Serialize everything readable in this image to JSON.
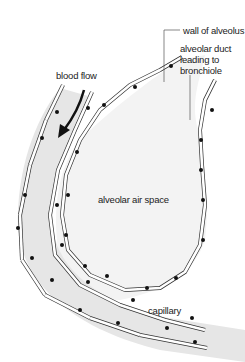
{
  "diagram": {
    "labels": {
      "wall": "wall of alveolus",
      "duct": "alveolar duct\nleading to\nbronchiole",
      "blood_flow": "blood flow",
      "air_space": "alveolar air space",
      "capillary": "capillary"
    },
    "colors": {
      "background": "#ffffff",
      "capillary_fill": "#e6e6e6",
      "air_space_fill": "#f3f3f3",
      "cell_outline": "#333333",
      "nucleus": "#111111",
      "leader_line": "#555555"
    }
  }
}
